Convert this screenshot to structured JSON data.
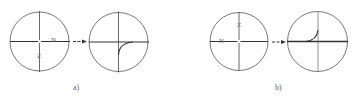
{
  "figure": {
    "panels": [
      {
        "label": "a)",
        "before": {
          "n_label": "N",
          "z_label": "Z"
        },
        "after": {
          "curve": "quarter arc from bottom-center joining horizontal axis to the right"
        }
      },
      {
        "label": "b)",
        "before": {
          "n_label": "N",
          "z_label": "Z"
        },
        "after": {
          "curve": "quarter arc from left of center on horizontal axis rising to vertical axis"
        }
      }
    ],
    "colors": {
      "line": "#333333",
      "thin": "#555555",
      "text": "#555555"
    }
  }
}
